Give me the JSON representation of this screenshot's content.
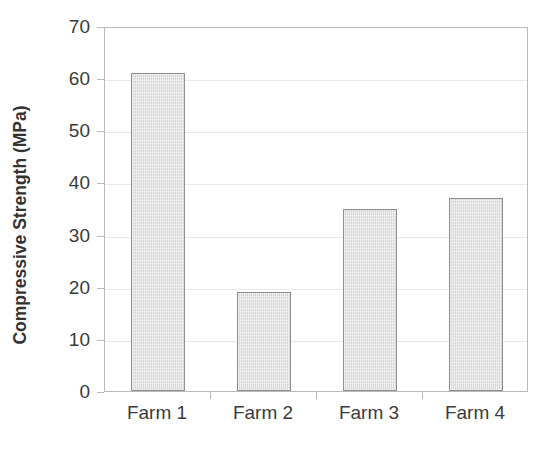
{
  "chart_data": {
    "type": "bar",
    "title": "",
    "subtitle": "",
    "xlabel": "",
    "ylabel": "Compressive Strength (MPa)",
    "categories": [
      "Farm 1",
      "Farm 2",
      "Farm 3",
      "Farm 4"
    ],
    "values": [
      61,
      19,
      35,
      37
    ],
    "series": [
      {
        "name": "Compressive Strength",
        "values": [
          61,
          19,
          35,
          37
        ]
      }
    ],
    "ylim": [
      0,
      70
    ],
    "ytick_values": [
      0,
      10,
      20,
      30,
      40,
      50,
      60,
      70
    ],
    "ytick_labels": [
      "0",
      "10",
      "20",
      "30",
      "40",
      "50",
      "60",
      "70"
    ],
    "grid": true,
    "grid_axis": "y",
    "legend": "none",
    "legend_position": "none",
    "bar_fill_color": "#d6d6d6",
    "bar_edge_color": "#8e8e8e",
    "grid_color": "#e8e8e8",
    "axis_color": "#b9b9b9",
    "text_color": "#3b3b3b",
    "background_color": "#ffffff"
  }
}
